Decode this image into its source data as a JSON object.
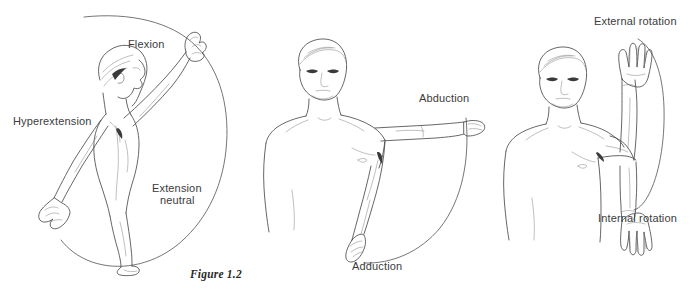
{
  "figure": {
    "caption": "Figure 1.2",
    "background_color": "#ffffff",
    "ink_color": "#4a4a4a",
    "label_color": "#3b3b3b",
    "width": 693,
    "height": 297,
    "panels": [
      {
        "id": "flexion-extension",
        "motion": "Shoulder flexion / extension (sagittal plane, lateral view)",
        "subject_view": "side-facing figure with right arm raised overhead",
        "labels": [
          {
            "name": "flexion",
            "text": "Flexion",
            "x": 128,
            "y": 38,
            "align": "left"
          },
          {
            "name": "hyperextension",
            "text": "Hyperextension",
            "x": 13,
            "y": 115,
            "align": "left"
          },
          {
            "name": "extension-neutral-line1",
            "text": "Extension",
            "x": 152,
            "y": 182,
            "align": "left"
          },
          {
            "name": "extension-neutral-line2",
            "text": "neutral",
            "x": 160,
            "y": 194,
            "align": "left"
          }
        ],
        "arc": "large open circular sweep from upper-left, around the right, down to bottom"
      },
      {
        "id": "abduction-adduction",
        "motion": "Shoulder abduction / adduction (coronal plane, front view)",
        "subject_view": "front-facing figure with left arm raised horizontally to the side",
        "labels": [
          {
            "name": "abduction",
            "text": "Abduction",
            "x": 419,
            "y": 92,
            "align": "left"
          },
          {
            "name": "adduction",
            "text": "Adduction",
            "x": 352,
            "y": 260,
            "align": "left"
          }
        ],
        "arc": "quarter-circle sweep from the horizontal hand down to the hanging hand"
      },
      {
        "id": "external-internal-rotation",
        "motion": "Shoulder external / internal rotation (arm abducted 90°, elbow flexed 90°)",
        "subject_view": "front-facing figure with left arm abducted, elbow bent, forearm shown up and down",
        "labels": [
          {
            "name": "external-rotation",
            "text": "External rotation",
            "x": 594,
            "y": 15,
            "align": "left"
          },
          {
            "name": "internal-rotation",
            "text": "Internal rotation",
            "x": 598,
            "y": 212,
            "align": "left"
          }
        ],
        "arc": "tall narrow vertical sweep linking the raised forearm to the lowered forearm"
      }
    ]
  }
}
